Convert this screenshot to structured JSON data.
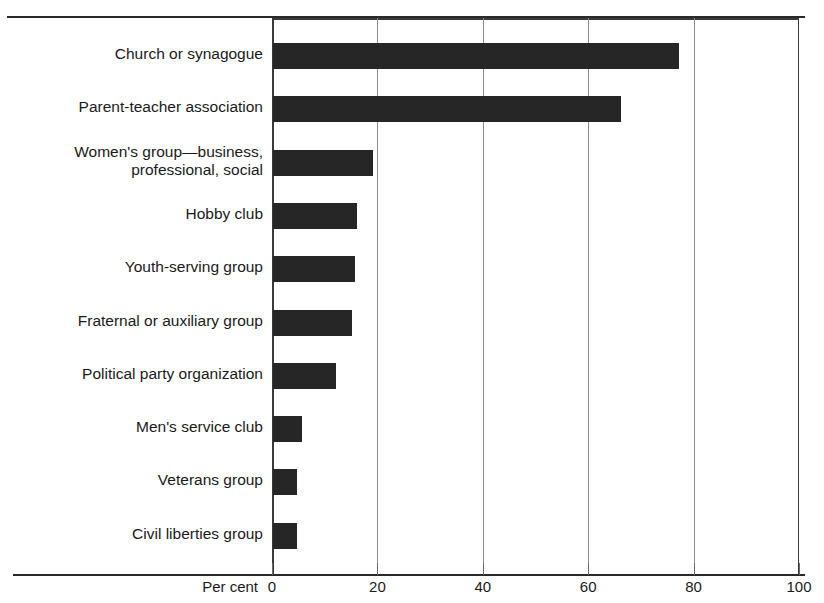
{
  "chart_data": {
    "type": "bar",
    "orientation": "horizontal",
    "title": "",
    "xlabel": "Per cent",
    "ylabel": "",
    "xlim": [
      0,
      100
    ],
    "xticks": [
      0,
      20,
      40,
      60,
      80,
      100
    ],
    "xtick_labels": [
      "0",
      "20",
      "40",
      "60",
      "80",
      "100"
    ],
    "grid": true,
    "legend": false,
    "bar_color": "#262626",
    "categories": [
      "Church or synagogue",
      "Parent-teacher association",
      "Women's group—business,\nprofessional, social",
      "Hobby club",
      "Youth-serving group",
      "Fraternal or auxiliary group",
      "Political party organization",
      "Men's service club",
      "Veterans group",
      "Civil liberties group"
    ],
    "values": [
      77,
      66,
      19,
      16,
      15.5,
      15,
      12,
      5.5,
      4.5,
      4.5
    ]
  }
}
